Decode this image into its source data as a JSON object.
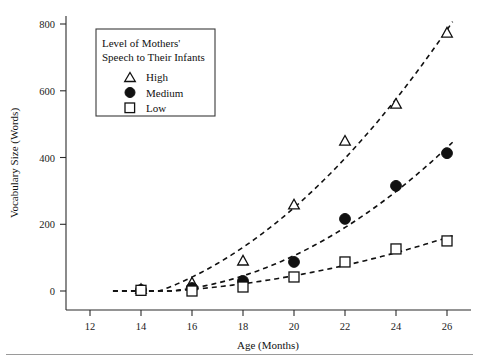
{
  "chart_data": {
    "type": "scatter",
    "title": "",
    "xlabel": "Age (Months)",
    "ylabel": "Vocabulary Size (Words)",
    "x": [
      14,
      16,
      18,
      20,
      22,
      24,
      26
    ],
    "xticks": [
      "12",
      "14",
      "16",
      "18",
      "20",
      "22",
      "24",
      "26"
    ],
    "yticks": [
      "0",
      "200",
      "400",
      "600",
      "800"
    ],
    "xlim": [
      12,
      27
    ],
    "ylim": [
      0,
      860
    ],
    "grid": false,
    "legend_position": "upper-left-inside",
    "series": [
      {
        "name": "High",
        "marker": "open-triangle",
        "values": [
          5,
          24,
          90,
          258,
          449,
          560,
          773
        ]
      },
      {
        "name": "Medium",
        "marker": "filled-circle",
        "values": [
          3,
          9,
          30,
          87,
          216,
          315,
          413
        ]
      },
      {
        "name": "Low",
        "marker": "open-square",
        "values": [
          2,
          0,
          12,
          42,
          87,
          126,
          150
        ]
      }
    ]
  },
  "legend": {
    "title_line1": "Level of Mothers'",
    "title_line2": "Speech to Their Infants",
    "entries": [
      {
        "label": "High",
        "marker": "open-triangle"
      },
      {
        "label": "Medium",
        "marker": "filled-circle"
      },
      {
        "label": "Low",
        "marker": "open-square"
      }
    ]
  },
  "axes": {
    "x_title": "Age (Months)",
    "y_title": "Vocabulary Size (Words)",
    "x_tick_labels": [
      "12",
      "14",
      "16",
      "18",
      "20",
      "22",
      "24",
      "26"
    ],
    "y_tick_labels": [
      "0",
      "200",
      "400",
      "600",
      "800"
    ]
  }
}
